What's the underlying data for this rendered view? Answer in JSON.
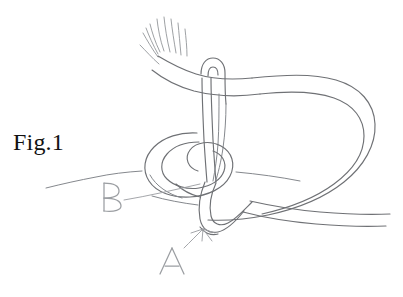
{
  "figure": {
    "caption": "Fig.1",
    "background_color": "#ffffff",
    "line_color": "#6f7175",
    "pencil_color": "#9b9ea2",
    "caption_color": "#111111",
    "width": 403,
    "height": 297
  },
  "callouts": [
    {
      "id": "callout-b",
      "label": "B",
      "label_x": 104,
      "label_y": 197,
      "leader_from_x": 124,
      "leader_from_y": 200,
      "leader_to_x": 200,
      "leader_to_y": 184,
      "has_arrowhead": false,
      "points_at": "coil-loop"
    },
    {
      "id": "callout-a",
      "label": "A",
      "label_x": 168,
      "label_y": 251,
      "leader_from_x": 184,
      "leader_from_y": 248,
      "leader_to_x": 202,
      "leader_to_y": 230,
      "has_arrowhead": true,
      "points_at": "rope-bight-bottom"
    }
  ],
  "parts": {
    "frayed_end": "unraveled rope strands fanning upper-left",
    "standing_part": "rope running from frayed end to the right",
    "bight": "narrow U-turn descending through the knot center",
    "coil": "spiral coil forming the knot body",
    "large_loop": "large bight sweeping around the right side"
  },
  "icons": {
    "arrow": "arrow-icon"
  }
}
